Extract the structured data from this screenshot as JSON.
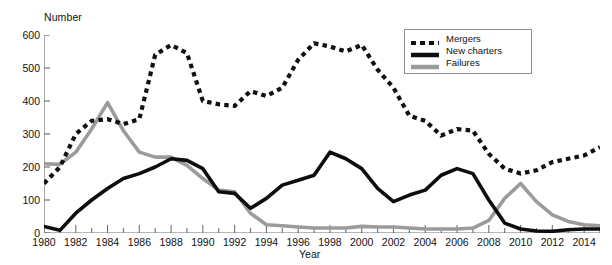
{
  "chart_data": {
    "type": "line",
    "title": "",
    "xlabel": "Year",
    "ylabel": "Number",
    "ylim": [
      0,
      600
    ],
    "xlim": [
      1980,
      2015
    ],
    "grid": false,
    "legend_position": "top-right",
    "y_ticks": [
      0,
      100,
      200,
      300,
      400,
      500,
      600
    ],
    "x_ticks": [
      1980,
      1982,
      1984,
      1986,
      1988,
      1990,
      1992,
      1994,
      1996,
      1998,
      2000,
      2002,
      2004,
      2006,
      2008,
      2010,
      2012,
      2014
    ],
    "x_tick_labels": [
      "1980",
      "1982",
      "1984",
      "1986",
      "1988",
      "1990",
      "1992",
      "1994",
      "1996",
      "1998",
      "2000",
      "2002",
      "2004",
      "2006",
      "2008",
      "2010",
      "2012",
      "2014"
    ],
    "y_tick_labels": [
      "0",
      "100",
      "200",
      "300",
      "400",
      "500",
      "600"
    ],
    "x": [
      1980,
      1981,
      1982,
      1983,
      1984,
      1985,
      1986,
      1987,
      1988,
      1989,
      1990,
      1991,
      1992,
      1993,
      1994,
      1995,
      1996,
      1997,
      1998,
      1999,
      2000,
      2001,
      2002,
      2003,
      2004,
      2005,
      2006,
      2007,
      2008,
      2009,
      2010,
      2011,
      2012,
      2013,
      2014,
      2015
    ],
    "series": [
      {
        "name": "Mergers",
        "style": "dashed",
        "color": "#111111",
        "values": [
          150,
          200,
          300,
          340,
          345,
          330,
          345,
          540,
          570,
          545,
          400,
          390,
          385,
          430,
          415,
          440,
          525,
          575,
          565,
          550,
          570,
          495,
          440,
          355,
          340,
          295,
          315,
          310,
          240,
          195,
          180,
          190,
          215,
          225,
          235,
          260
        ]
      },
      {
        "name": "New charters",
        "style": "solid",
        "color": "#0d0d0d",
        "values": [
          20,
          8,
          60,
          100,
          135,
          165,
          180,
          200,
          225,
          220,
          195,
          125,
          120,
          75,
          105,
          145,
          160,
          175,
          245,
          225,
          195,
          135,
          95,
          115,
          130,
          175,
          195,
          180,
          100,
          30,
          12,
          6,
          5,
          10,
          12,
          12
        ]
      },
      {
        "name": "Failures",
        "style": "solid",
        "color": "#9b9b9b",
        "values": [
          210,
          208,
          245,
          315,
          395,
          310,
          245,
          230,
          230,
          205,
          165,
          130,
          125,
          60,
          25,
          22,
          18,
          15,
          15,
          15,
          20,
          18,
          18,
          15,
          12,
          12,
          12,
          15,
          38,
          105,
          150,
          95,
          55,
          35,
          25,
          22
        ]
      }
    ]
  },
  "legend": {
    "entries": [
      {
        "label": "Mergers",
        "icon": "dashed-line-swatch"
      },
      {
        "label": "New charters",
        "icon": "solid-black-line-swatch"
      },
      {
        "label": "Failures",
        "icon": "solid-gray-line-swatch"
      }
    ]
  },
  "cut_text": {
    "value": ""
  }
}
